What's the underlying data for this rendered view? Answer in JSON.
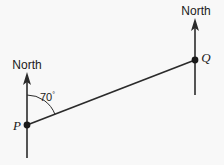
{
  "diagram": {
    "type": "bearing-diagram",
    "background_color": "#f8f8f8",
    "stroke_color": "#2b2b2b",
    "text_color": "#1a1a1a",
    "width": 224,
    "height": 165,
    "north_label_left": "North",
    "north_label_right": "North",
    "point_p_label": "P",
    "point_q_label": "Q",
    "angle_value": "70",
    "angle_unit": "°",
    "angle_label": "70°",
    "geometry": {
      "point_p": {
        "x": 27,
        "y": 125
      },
      "point_q": {
        "x": 195,
        "y": 60
      },
      "north_line_left": {
        "x": 27,
        "y_bottom": 158,
        "y_tip": 73
      },
      "north_line_right": {
        "x": 195,
        "y_bottom": 95,
        "y_tip": 19
      },
      "angle_arc_radius": 30,
      "bearing_degrees": 70
    }
  }
}
